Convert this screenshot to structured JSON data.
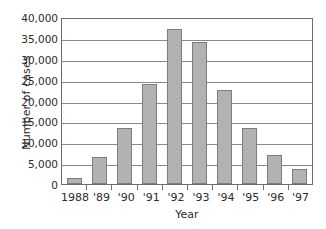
{
  "chart_data": {
    "type": "bar",
    "title": "",
    "xlabel": "Year",
    "ylabel": "Number of cases",
    "categories": [
      "1988",
      "'89",
      "'90",
      "'91",
      "'92",
      "'93",
      "'94",
      "'95",
      "'96",
      "'97"
    ],
    "values": [
      1400,
      6400,
      13300,
      23900,
      37200,
      34000,
      22500,
      13300,
      6900,
      3600
    ],
    "ylim": [
      0,
      40000
    ],
    "ytick_labels": [
      "0",
      "5,000",
      "10,000",
      "15,000",
      "20,000",
      "25,000",
      "30,000",
      "35,000",
      "40,000"
    ],
    "ytick_values": [
      0,
      5000,
      10000,
      15000,
      20000,
      25000,
      30000,
      35000,
      40000
    ],
    "grid": "horizontal",
    "legend": "none",
    "bar_color": "#b2b2b2",
    "bar_border_color": "#7d7d7d",
    "axis_color": "#6e6e6e"
  }
}
